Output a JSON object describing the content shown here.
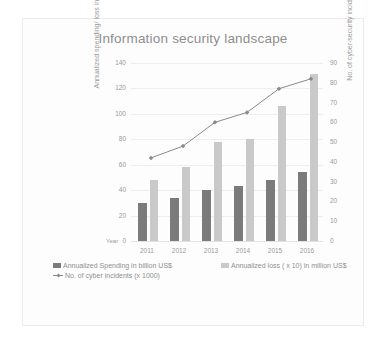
{
  "chart_data": {
    "type": "bar",
    "title": "Information security landscape",
    "xlabel": "Year",
    "ylabel": "Annualized spending/ loss in US dollars",
    "y2label": "No. of cyber-security incidents (x1000)",
    "categories": [
      "2011",
      "2012",
      "2013",
      "2014",
      "2015",
      "2016"
    ],
    "ylim": [
      0,
      140
    ],
    "y2lim": [
      0,
      90
    ],
    "yticks": [
      "140",
      "120",
      "100",
      "80",
      "60",
      "40",
      "20",
      "0"
    ],
    "y2ticks": [
      "90",
      "80",
      "70",
      "60",
      "50",
      "40",
      "30",
      "20",
      "10",
      "0"
    ],
    "grid": true,
    "legend_position": "bottom-left",
    "series": [
      {
        "name": "Annualized Spending in billion US$",
        "type": "bar",
        "axis": "left",
        "color": "#7b7b7b",
        "values": [
          30,
          34,
          40,
          43,
          48,
          54
        ]
      },
      {
        "name": "Annualized loss ( x 10) in million US$",
        "type": "bar",
        "axis": "left",
        "color": "#c9c9c9",
        "values": [
          48,
          58,
          78,
          80,
          106,
          131
        ]
      },
      {
        "name": "No. of cyber incidents (x 1000)",
        "type": "line",
        "axis": "right",
        "color": "#8a8a8a",
        "values": [
          42,
          48,
          60,
          65,
          77,
          82
        ]
      }
    ]
  },
  "colors": {
    "spending_bar": "#7b7b7b",
    "loss_bar": "#c9c9c9",
    "incident_line": "#8a8a8a",
    "gridline": "#eeeeee",
    "text": "#9a9a9a"
  }
}
